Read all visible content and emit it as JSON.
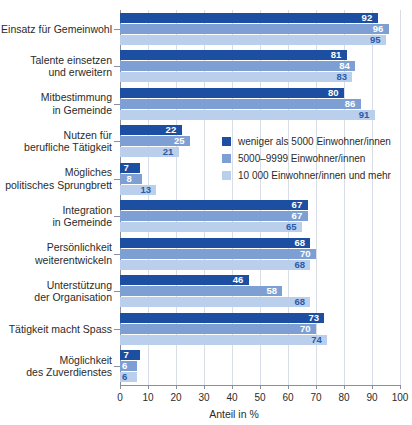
{
  "chart_data": {
    "type": "bar",
    "orientation": "horizontal",
    "title": "",
    "xlabel": "Anteil in %",
    "ylabel": "",
    "xlim": [
      0,
      100
    ],
    "xticks": [
      0,
      10,
      20,
      30,
      40,
      50,
      60,
      70,
      80,
      90,
      100
    ],
    "grid": true,
    "legend_position": "inside-upper-right",
    "categories": [
      "Einsatz für Gemeinwohl",
      "Talente einsetzen und erweitern",
      "Mitbestimmung in Gemeinde",
      "Nutzen für berufliche Tätigkeit",
      "Mögliches politisches Sprungbrett",
      "Integration in Gemeinde",
      "Persönlichkeit weiterentwickeln",
      "Unterstützung der Organisation",
      "Tätigkeit macht Spass",
      "Möglichkeit des Zuverdienstes"
    ],
    "category_lines": [
      [
        "Einsatz für Gemeinwohl"
      ],
      [
        "Talente einsetzen",
        "und erweitern"
      ],
      [
        "Mitbestimmung",
        "in Gemeinde"
      ],
      [
        "Nutzen für",
        "berufliche Tätigkeit"
      ],
      [
        "Mögliches",
        "politisches Sprungbrett"
      ],
      [
        "Integration",
        "in Gemeinde"
      ],
      [
        "Persönlichkeit",
        "weiterentwickeln"
      ],
      [
        "Unterstützung",
        "der Organisation"
      ],
      [
        "Tätigkeit macht Spass"
      ],
      [
        "Möglichkeit",
        "des Zuverdienstes"
      ]
    ],
    "series": [
      {
        "name": "weniger als 5000 Einwohner/innen",
        "color": "#1c4fa1",
        "values": [
          92,
          81,
          80,
          22,
          7,
          67,
          68,
          46,
          73,
          7
        ]
      },
      {
        "name": "5000–9999 Einwohner/innen",
        "color": "#7e9fd4",
        "values": [
          96,
          84,
          86,
          25,
          8,
          67,
          70,
          58,
          70,
          6
        ]
      },
      {
        "name": "10 000 Einwohner/innen und mehr",
        "color": "#b9cfeb",
        "values": [
          95,
          83,
          91,
          21,
          13,
          65,
          68,
          68,
          74,
          6
        ]
      }
    ]
  },
  "legend": {
    "items": [
      {
        "label": "weniger als 5000 Einwohner/innen",
        "color": "#1c4fa1"
      },
      {
        "label": "5000–9999 Einwohner/innen",
        "color": "#7e9fd4"
      },
      {
        "label": "10 000 Einwohner/innen und mehr",
        "color": "#b9cfeb"
      }
    ]
  },
  "axis": {
    "x_title": "Anteil in %",
    "x_tick_labels": [
      "0",
      "10",
      "20",
      "30",
      "40",
      "50",
      "60",
      "70",
      "80",
      "90",
      "100"
    ]
  }
}
